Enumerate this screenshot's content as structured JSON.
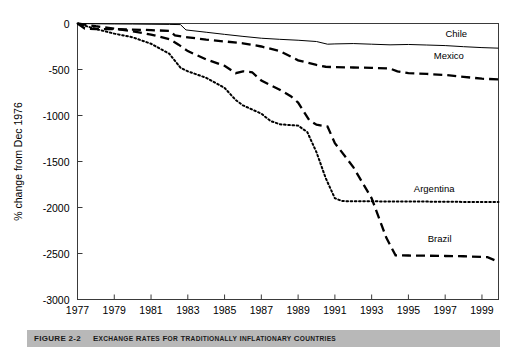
{
  "figure": {
    "caption_number": "FIGURE 2-2",
    "caption_title_lead": "E",
    "caption_title": "XCHANGE ",
    "caption_full": "EXCHANGE RATES FOR TRADITIONALLY INFLATIONARY COUNTRIES",
    "caption_bar_color": "#b8b8b8"
  },
  "chart_data": {
    "type": "line",
    "title": "Exchange Rates for Traditionally Inflationary Countries",
    "xlabel": "",
    "ylabel": "% change from Dec 1976",
    "xlim": [
      1977,
      1999.9
    ],
    "ylim": [
      -3000,
      0
    ],
    "xticks": [
      1977,
      1979,
      1981,
      1983,
      1985,
      1987,
      1989,
      1991,
      1993,
      1995,
      1997,
      1999
    ],
    "yticks": [
      0,
      -500,
      -1000,
      -1500,
      -2000,
      -2500,
      -3000
    ],
    "xtick_labels": [
      "1977",
      "1979",
      "1981",
      "1983",
      "1985",
      "1987",
      "1989",
      "1991",
      "1993",
      "1995",
      "1997",
      "1999"
    ],
    "ytick_labels": [
      "0",
      "-500",
      "-1000",
      "-1500",
      "-2000",
      "-2500",
      "-3000"
    ],
    "grid": false,
    "legend_position": "inline-right-of-series",
    "series": [
      {
        "name": "Chile",
        "label": "Chile",
        "style": "solid",
        "color": "#000000",
        "label_xy": [
          1997.6,
          -150
        ],
        "points": [
          [
            1977,
            0
          ],
          [
            1978,
            -3
          ],
          [
            1979,
            -5
          ],
          [
            1980,
            -6
          ],
          [
            1981,
            -8
          ],
          [
            1982,
            -10
          ],
          [
            1982.6,
            -12
          ],
          [
            1982.9,
            -70
          ],
          [
            1984,
            -95
          ],
          [
            1985,
            -118
          ],
          [
            1986,
            -140
          ],
          [
            1987,
            -160
          ],
          [
            1988,
            -172
          ],
          [
            1989,
            -182
          ],
          [
            1990,
            -196
          ],
          [
            1990.6,
            -225
          ],
          [
            1991,
            -222
          ],
          [
            1992,
            -218
          ],
          [
            1993,
            -225
          ],
          [
            1994,
            -232
          ],
          [
            1995,
            -228
          ],
          [
            1996,
            -234
          ],
          [
            1997,
            -240
          ],
          [
            1998,
            -252
          ],
          [
            1999,
            -262
          ],
          [
            1999.9,
            -268
          ]
        ]
      },
      {
        "name": "Mexico",
        "label": "Mexico",
        "style": "dashed",
        "color": "#000000",
        "label_xy": [
          1997.2,
          -390
        ],
        "points": [
          [
            1977,
            0
          ],
          [
            1977.4,
            -55
          ],
          [
            1978,
            -60
          ],
          [
            1979,
            -62
          ],
          [
            1980,
            -66
          ],
          [
            1981,
            -72
          ],
          [
            1982,
            -80
          ],
          [
            1982.3,
            -130
          ],
          [
            1983,
            -150
          ],
          [
            1984,
            -175
          ],
          [
            1985,
            -195
          ],
          [
            1986,
            -215
          ],
          [
            1987,
            -250
          ],
          [
            1988,
            -300
          ],
          [
            1989,
            -400
          ],
          [
            1990,
            -450
          ],
          [
            1990.5,
            -470
          ],
          [
            1991,
            -475
          ],
          [
            1992,
            -478
          ],
          [
            1993,
            -482
          ],
          [
            1994,
            -490
          ],
          [
            1994.4,
            -520
          ],
          [
            1995,
            -540
          ],
          [
            1996,
            -548
          ],
          [
            1997,
            -560
          ],
          [
            1998,
            -580
          ],
          [
            1999,
            -600
          ],
          [
            1999.9,
            -608
          ]
        ]
      },
      {
        "name": "Argentina",
        "label": "Argentina",
        "style": "dotted",
        "color": "#000000",
        "label_xy": [
          1996.4,
          -1830
        ],
        "points": [
          [
            1977,
            0
          ],
          [
            1978,
            -60
          ],
          [
            1979,
            -110
          ],
          [
            1980,
            -150
          ],
          [
            1981,
            -220
          ],
          [
            1982,
            -330
          ],
          [
            1982.6,
            -480
          ],
          [
            1983,
            -520
          ],
          [
            1984,
            -590
          ],
          [
            1985,
            -700
          ],
          [
            1985.6,
            -830
          ],
          [
            1986,
            -890
          ],
          [
            1987,
            -980
          ],
          [
            1987.5,
            -1060
          ],
          [
            1988,
            -1095
          ],
          [
            1988.6,
            -1105
          ],
          [
            1989,
            -1110
          ],
          [
            1989.5,
            -1180
          ],
          [
            1990,
            -1400
          ],
          [
            1990.5,
            -1680
          ],
          [
            1991,
            -1900
          ],
          [
            1991.4,
            -1930
          ],
          [
            1992,
            -1932
          ],
          [
            1993,
            -1933
          ],
          [
            1994,
            -1934
          ],
          [
            1995,
            -1935
          ],
          [
            1996,
            -1936
          ],
          [
            1997,
            -1938
          ],
          [
            1998,
            -1939
          ],
          [
            1999.9,
            -1940
          ]
        ]
      },
      {
        "name": "Brazil",
        "label": "Brazil",
        "style": "dashed",
        "color": "#000000",
        "label_xy": [
          1996.7,
          -2370
        ],
        "points": [
          [
            1977,
            0
          ],
          [
            1978,
            -30
          ],
          [
            1979,
            -55
          ],
          [
            1980,
            -85
          ],
          [
            1981,
            -120
          ],
          [
            1982,
            -170
          ],
          [
            1982.5,
            -230
          ],
          [
            1983,
            -300
          ],
          [
            1984,
            -390
          ],
          [
            1985,
            -460
          ],
          [
            1985.6,
            -540
          ],
          [
            1986,
            -520
          ],
          [
            1986.5,
            -530
          ],
          [
            1987,
            -620
          ],
          [
            1988,
            -720
          ],
          [
            1988.6,
            -790
          ],
          [
            1989,
            -860
          ],
          [
            1989.6,
            -1050
          ],
          [
            1990,
            -1100
          ],
          [
            1990.6,
            -1120
          ],
          [
            1991,
            -1300
          ],
          [
            1992,
            -1560
          ],
          [
            1993,
            -1900
          ],
          [
            1993.8,
            -2330
          ],
          [
            1994.3,
            -2520
          ],
          [
            1995,
            -2522
          ],
          [
            1996,
            -2524
          ],
          [
            1997,
            -2527
          ],
          [
            1998,
            -2530
          ],
          [
            1999.3,
            -2540
          ],
          [
            1999.9,
            -2590
          ]
        ]
      }
    ]
  }
}
